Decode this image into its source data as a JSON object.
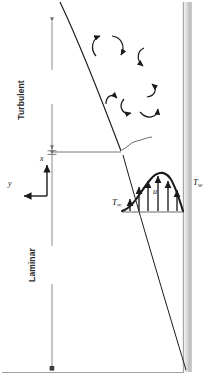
{
  "figure": {
    "colors": {
      "line": "#1a1a1a",
      "thin_line": "#555555",
      "dimension_line": "#6e6e6e",
      "wall_light": "#f2f2f2",
      "wall_mid": "#c9c9c9",
      "wall_dark": "#a8a8a8",
      "background": "#ffffff"
    }
  },
  "labels": {
    "x_axis": "x",
    "y_axis": "y",
    "velocity": "u",
    "temp_free_stream_base": "T",
    "temp_free_stream_sub": "∞",
    "temp_wall_base": "T",
    "temp_wall_sub": "w",
    "region_turbulent": "Turbulent",
    "region_laminar": "Laminar"
  },
  "diagram_data": {
    "type": "schematic",
    "wall": {
      "orientation": "vertical",
      "x_left": 183,
      "x_right": 191,
      "y_top": 2,
      "y_bottom": 372,
      "shading": "gray-gradient"
    },
    "boundary_layer_edge": {
      "description": "curve from top-left widening downward to wall base",
      "start": [
        60,
        2
      ],
      "transition_point": [
        122,
        152
      ],
      "end": [
        186,
        370
      ]
    },
    "transition": {
      "y": 152,
      "tick_line_from_x": 52,
      "tick_line_to_x": 122,
      "squiggle": true
    },
    "regions": [
      {
        "name": "Turbulent",
        "dimension_x": 52,
        "y_top": 18,
        "y_bottom": 150
      },
      {
        "name": "Laminar",
        "dimension_x": 52,
        "y_top": 156,
        "y_bottom": 368
      }
    ],
    "coordinate_axes": {
      "origin": [
        47,
        196
      ],
      "x_arrow_to": [
        47,
        160
      ],
      "y_arrow_to": [
        20,
        196
      ]
    },
    "velocity_profile": {
      "baseline_y": 212,
      "x_start": 124,
      "x_end": 184,
      "peak_x": 158,
      "peak_y": 174,
      "arrow_count": 6,
      "arrow_x_positions": [
        133,
        141,
        150,
        159,
        168,
        177
      ],
      "arrow_heights": [
        14,
        28,
        36,
        38,
        33,
        24
      ]
    },
    "eddies": {
      "count": 7,
      "description": "curved arrows indicating turbulent eddies",
      "positions": [
        [
          99,
          42
        ],
        [
          117,
          38
        ],
        [
          141,
          55
        ],
        [
          112,
          100
        ],
        [
          131,
          104
        ],
        [
          153,
          92
        ],
        [
          148,
          112
        ]
      ]
    },
    "baseline": {
      "y": 372,
      "x_from": 2,
      "x_to": 191
    }
  }
}
